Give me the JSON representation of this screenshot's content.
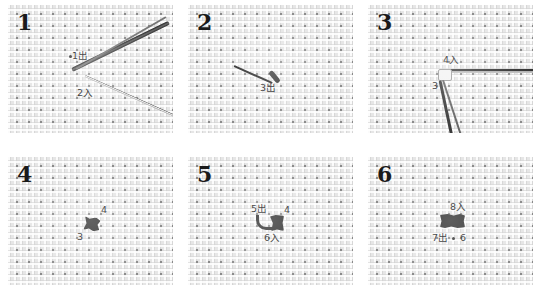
{
  "panels": [
    {
      "step": "1",
      "labels": [
        {
          "id": "p1-out",
          "text": "1出"
        },
        {
          "id": "p1-in",
          "text": "2入"
        }
      ]
    },
    {
      "step": "2",
      "labels": [
        {
          "id": "p2-out",
          "text": "3出"
        }
      ]
    },
    {
      "step": "3",
      "labels": [
        {
          "id": "p3-in",
          "text": "4入"
        },
        {
          "id": "p3-pt",
          "text": "3"
        }
      ]
    },
    {
      "step": "4",
      "labels": [
        {
          "id": "p4-pt4",
          "text": "4"
        },
        {
          "id": "p4-pt3",
          "text": "3"
        }
      ]
    },
    {
      "step": "5",
      "labels": [
        {
          "id": "p5-out",
          "text": "5出"
        },
        {
          "id": "p5-pt4",
          "text": "4"
        },
        {
          "id": "p5-in",
          "text": "6入"
        }
      ]
    },
    {
      "step": "6",
      "labels": [
        {
          "id": "p6-in",
          "text": "8入"
        },
        {
          "id": "p6-out",
          "text": "7出"
        },
        {
          "id": "p6-pt6",
          "text": "6"
        }
      ]
    }
  ],
  "colors": {
    "fabric": "#e6e6e6",
    "thread": "#3a3a3a",
    "text": "#222222"
  }
}
